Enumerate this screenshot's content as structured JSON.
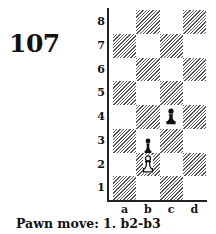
{
  "puzzle": {
    "number": "107",
    "caption": "Pawn move: 1. b2-b3"
  },
  "board": {
    "files": [
      "a",
      "b",
      "c",
      "d"
    ],
    "ranks": [
      "8",
      "7",
      "6",
      "5",
      "4",
      "3",
      "2",
      "1"
    ],
    "dark_color": "#555555",
    "light_color": "#ffffff",
    "pieces": [
      {
        "square": "c4",
        "type": "pawn",
        "color": "black",
        "icon": "black-pawn-icon"
      },
      {
        "square": "b2",
        "type": "pawn",
        "color": "white",
        "icon": "white-pawn-icon"
      },
      {
        "square": "b2",
        "type": "arrow-marker",
        "color": "black",
        "icon": "black-pawn-move-marker-icon",
        "note": "black pawn glyph drawn above white pawn indicating move to b3"
      }
    ]
  }
}
